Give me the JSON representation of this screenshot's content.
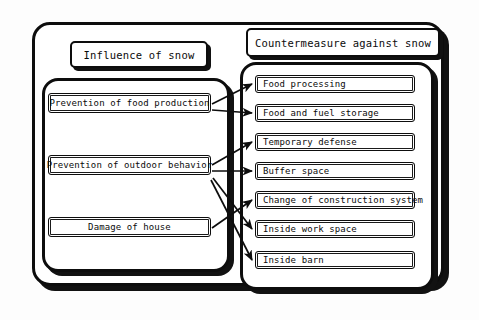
{
  "diagram": {
    "title_left": "Influence of snow",
    "title_right": "Countermeasure against snow",
    "left_items": [
      {
        "id": "food-production",
        "label": "Prevention of food production"
      },
      {
        "id": "outdoor-behavior",
        "label": "Prevention of outdoor behavior"
      },
      {
        "id": "damage-house",
        "label": "Damage of house"
      }
    ],
    "right_items": [
      {
        "id": "food-processing",
        "label": "Food processing"
      },
      {
        "id": "food-fuel-storage",
        "label": "Food and fuel storage"
      },
      {
        "id": "temporary-defense",
        "label": "Temporary defense"
      },
      {
        "id": "buffer-space",
        "label": "Buffer space"
      },
      {
        "id": "construction",
        "label": "Change of construction system"
      },
      {
        "id": "inside-work-space",
        "label": "Inside work space"
      },
      {
        "id": "inside-barn",
        "label": "Inside barn"
      }
    ],
    "links": [
      {
        "from": "food-production",
        "to": "food-processing"
      },
      {
        "from": "food-production",
        "to": "food-fuel-storage"
      },
      {
        "from": "outdoor-behavior",
        "to": "temporary-defense"
      },
      {
        "from": "outdoor-behavior",
        "to": "buffer-space"
      },
      {
        "from": "outdoor-behavior",
        "to": "inside-work-space"
      },
      {
        "from": "outdoor-behavior",
        "to": "inside-barn"
      },
      {
        "from": "damage-house",
        "to": "construction"
      }
    ],
    "colors": {
      "stroke": "#0d0d0d",
      "shadow": "#111111",
      "background": "#ffffff"
    }
  }
}
